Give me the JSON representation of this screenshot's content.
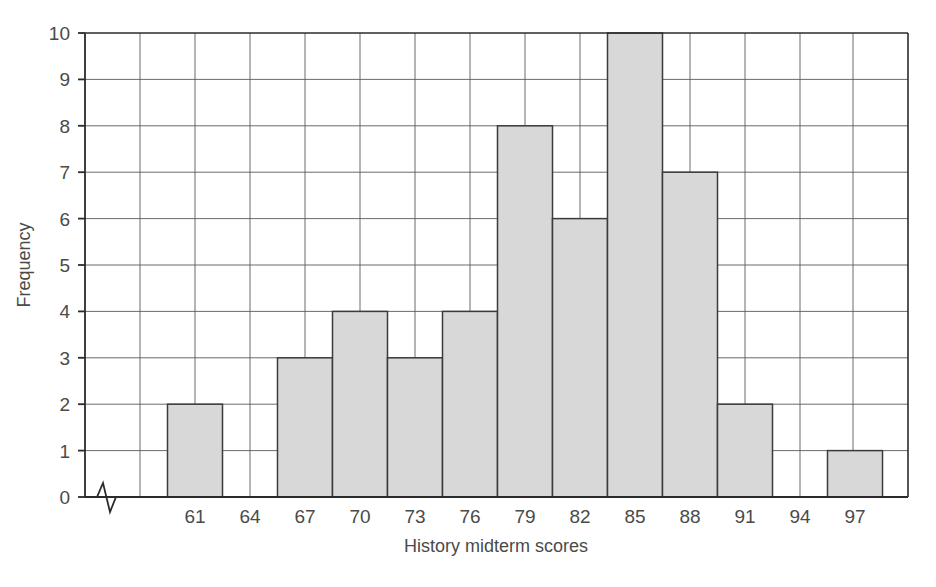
{
  "chart_data": {
    "type": "bar",
    "title": "",
    "xlabel": "History midterm scores",
    "ylabel": "Frequency",
    "categories": [
      "61",
      "64",
      "67",
      "70",
      "73",
      "76",
      "79",
      "82",
      "85",
      "88",
      "91",
      "94",
      "97"
    ],
    "values": [
      2,
      0,
      3,
      4,
      3,
      4,
      8,
      6,
      10,
      7,
      2,
      0,
      1
    ],
    "xtick_labels": [
      "61",
      "64",
      "67",
      "70",
      "73",
      "76",
      "79",
      "82",
      "85",
      "88",
      "91",
      "94",
      "97"
    ],
    "ytick_labels": [
      "0",
      "1",
      "2",
      "3",
      "4",
      "5",
      "6",
      "7",
      "8",
      "9",
      "10"
    ],
    "ylim": [
      0,
      10
    ],
    "ytick_step": 1,
    "grid": true,
    "legend": "none",
    "axis_break": "x-axis break near origin",
    "bar_fill_color": "#d8d8d8",
    "bar_edge_color": "#3b3b3b",
    "grid_color": "#5a5a5a",
    "frame_color": "#2b2b2b",
    "background_color": "#ffffff"
  },
  "figure": {
    "xlabel": "History midterm scores",
    "ylabel": "Frequency"
  }
}
